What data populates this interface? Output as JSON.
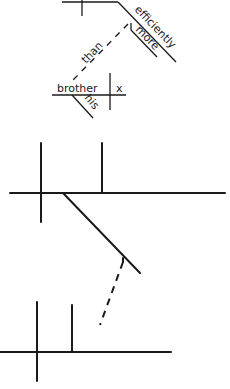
{
  "diagram": {
    "type": "sentence-diagram",
    "top_fragment": {
      "words": {
        "efficiently": "efficiently",
        "more": "more",
        "than": "than",
        "brother": "brother",
        "x": "x",
        "his": "his"
      }
    },
    "middle_fragment": {
      "words": []
    },
    "bottom_fragment": {
      "words": []
    }
  },
  "colors": {
    "ink": "#1a1a1a",
    "background": "#ffffff"
  }
}
